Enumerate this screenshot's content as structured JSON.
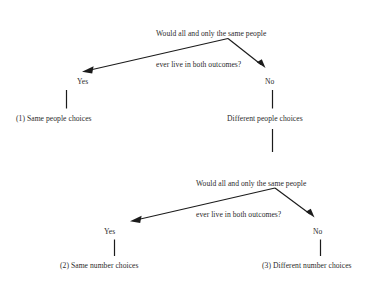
{
  "diagram": {
    "type": "decision-tree",
    "title_text": null,
    "background_color": "#ffffff",
    "line_color": "#1b1b1b",
    "text_color": "#2b2b2b",
    "questions": [
      {
        "id": "q1",
        "line1": "Would all and only the same people",
        "line2": "ever live in both outcomes?"
      },
      {
        "id": "q2",
        "line1": "Would all and only the same people",
        "line2": "ever live in both outcomes?"
      }
    ],
    "branch_labels": {
      "q1_yes": "Yes",
      "q1_no": "No",
      "q2_yes": "Yes",
      "q2_no": "No"
    },
    "outcomes": [
      {
        "id": "o1",
        "label": "(1) Same people choices"
      },
      {
        "id": "o2",
        "label": "Different people choices"
      },
      {
        "id": "o3",
        "label": "(2) Same number choices"
      },
      {
        "id": "o4",
        "label": "(3) Different number choices"
      }
    ]
  }
}
